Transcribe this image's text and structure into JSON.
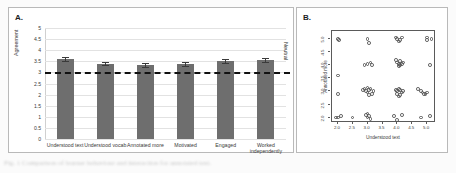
{
  "figure": {
    "caption_fragment": "Fig. 1  Comparison of learner behaviour and interaction for annotated text."
  },
  "panelA": {
    "letter": "A.",
    "ylabel": "Agreement",
    "yticks": [
      "5",
      "4.5",
      "4",
      "3.5",
      "3",
      "2.5",
      "2",
      "1.5",
      "1",
      "0.5",
      "0"
    ],
    "neutral_label": "Neutral",
    "neutral_value": 3,
    "bar_color": "#6e6e6e"
  },
  "panelB": {
    "letter": "B.",
    "xlabel": "Understood text",
    "ylabel": "Annotated more",
    "xticks": [
      "2.0",
      "2.5",
      "3.0",
      "3.5",
      "4.0",
      "4.5",
      "5.0"
    ],
    "yticks": [
      "2.0",
      "2.5",
      "3.0",
      "3.5",
      "4.0",
      "4.5",
      "5.0"
    ]
  },
  "chart_data": [
    {
      "type": "bar",
      "panel": "A",
      "title": "",
      "xlabel": "",
      "ylabel": "Agreement",
      "ylim": [
        0,
        5
      ],
      "ytick_step": 0.5,
      "grid": true,
      "legend": "none",
      "reference_line": {
        "value": 3,
        "label": "Neutral",
        "style": "dashed",
        "color": "#111111"
      },
      "categories": [
        "Understood text",
        "Understood vocab",
        "Annotated more",
        "Motivated",
        "Engaged",
        "Worked independently"
      ],
      "values": [
        3.6,
        3.4,
        3.33,
        3.38,
        3.52,
        3.54
      ],
      "errors": [
        0.1,
        0.08,
        0.09,
        0.09,
        0.1,
        0.09
      ]
    },
    {
      "type": "scatter",
      "panel": "B",
      "title": "",
      "xlabel": "Understood text",
      "ylabel": "Annotated more",
      "xlim": [
        1.8,
        5.3
      ],
      "ylim": [
        1.8,
        5.3
      ],
      "grid": false,
      "legend": "none",
      "points": [
        [
          2.0,
          5.0
        ],
        [
          2.05,
          4.95
        ],
        [
          2.0,
          3.6
        ],
        [
          2.0,
          2.9
        ],
        [
          2.0,
          2.0
        ],
        [
          2.1,
          2.05
        ],
        [
          1.95,
          2.0
        ],
        [
          2.5,
          2.0
        ],
        [
          3.0,
          5.0
        ],
        [
          3.05,
          4.85
        ],
        [
          2.9,
          4.0
        ],
        [
          3.0,
          4.05
        ],
        [
          3.1,
          4.1
        ],
        [
          3.15,
          4.0
        ],
        [
          2.9,
          3.1
        ],
        [
          3.0,
          3.15
        ],
        [
          3.05,
          3.05
        ],
        [
          3.1,
          3.1
        ],
        [
          3.0,
          2.95
        ],
        [
          2.95,
          3.0
        ],
        [
          3.15,
          2.9
        ],
        [
          3.05,
          2.85
        ],
        [
          3.2,
          3.0
        ],
        [
          2.85,
          3.05
        ],
        [
          3.0,
          2.15
        ],
        [
          3.05,
          2.05
        ],
        [
          3.0,
          2.0
        ],
        [
          3.1,
          1.95
        ],
        [
          2.95,
          2.1
        ],
        [
          3.95,
          5.05
        ],
        [
          4.0,
          5.0
        ],
        [
          4.1,
          4.95
        ],
        [
          4.15,
          5.05
        ],
        [
          4.05,
          4.9
        ],
        [
          3.95,
          4.2
        ],
        [
          4.0,
          4.1
        ],
        [
          4.05,
          4.05
        ],
        [
          4.1,
          4.0
        ],
        [
          4.15,
          4.05
        ],
        [
          4.2,
          4.1
        ],
        [
          4.1,
          4.15
        ],
        [
          4.05,
          3.95
        ],
        [
          3.95,
          3.05
        ],
        [
          4.0,
          3.0
        ],
        [
          4.05,
          3.1
        ],
        [
          4.1,
          3.05
        ],
        [
          4.15,
          2.95
        ],
        [
          4.2,
          3.0
        ],
        [
          4.0,
          2.9
        ],
        [
          4.1,
          2.85
        ],
        [
          4.05,
          2.8
        ],
        [
          3.9,
          2.05
        ],
        [
          4.15,
          2.1
        ],
        [
          4.0,
          1.9
        ],
        [
          4.7,
          3.1
        ],
        [
          4.8,
          3.0
        ],
        [
          4.85,
          2.95
        ],
        [
          4.9,
          2.9
        ],
        [
          5.0,
          2.95
        ],
        [
          4.95,
          2.9
        ],
        [
          4.8,
          2.0
        ],
        [
          5.1,
          2.05
        ],
        [
          5.0,
          5.05
        ],
        [
          5.15,
          5.0
        ],
        [
          5.0,
          4.95
        ],
        [
          5.1,
          4.0
        ]
      ]
    }
  ]
}
